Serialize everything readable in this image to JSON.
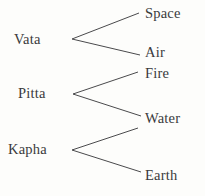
{
  "diagram": {
    "type": "tree",
    "colors": {
      "background": "#fdfdfb",
      "line": "#4a4a4c",
      "text": "#3a3a3c"
    },
    "doshas": [
      {
        "id": "vata",
        "label": "Vata",
        "elements": [
          "Space",
          "Air"
        ]
      },
      {
        "id": "pitta",
        "label": "Pitta",
        "elements": [
          "Fire",
          "Water"
        ]
      },
      {
        "id": "kapha",
        "label": "Kapha",
        "elements": [
          "Water",
          "Earth"
        ]
      }
    ],
    "elements": {
      "space": "Space",
      "air": "Air",
      "fire": "Fire",
      "water": "Water",
      "earth": "Earth"
    }
  }
}
